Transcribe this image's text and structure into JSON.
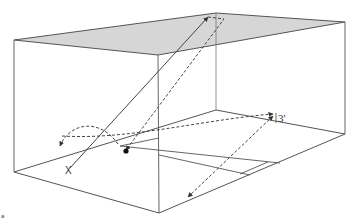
{
  "diagram": {
    "type": "3d-box-trajectory",
    "colors": {
      "edge": "#555555",
      "ceiling_fill": "#d6d6d6",
      "dashed": "#444444",
      "point": "#111111"
    },
    "labels": {
      "x_marker": "X",
      "height_label": "3'",
      "fig_mark": "a"
    }
  }
}
